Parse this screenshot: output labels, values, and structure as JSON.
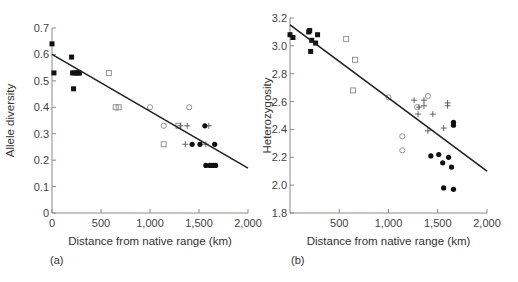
{
  "figure": {
    "panels": [
      "(a)",
      "(b)"
    ]
  },
  "chart_data": [
    {
      "type": "scatter",
      "panel_label": "(a)",
      "title": "",
      "xlabel": "Distance from native range (km)",
      "ylabel": "Allele diversity",
      "xlim": [
        0,
        2000
      ],
      "ylim": [
        0,
        0.7
      ],
      "xticks": [
        0,
        500,
        1000,
        1500,
        2000
      ],
      "xtick_labels": [
        "0",
        "500",
        "1,000",
        "1,500",
        "2,000"
      ],
      "yticks": [
        0,
        0.1,
        0.2,
        0.3,
        0.4,
        0.5,
        0.6,
        0.7
      ],
      "ytick_labels": [
        "0",
        "0.1",
        "0.2",
        "0.3",
        "0.4",
        "0.5",
        "0.6",
        "0.7"
      ],
      "grid": false,
      "legend": null,
      "regression_line": {
        "x": [
          0,
          2000
        ],
        "y": [
          0.6,
          0.17
        ]
      },
      "series": [
        {
          "name": "filled-square",
          "marker": "square-filled",
          "x": [
            0,
            20,
            200,
            210,
            220,
            230,
            250,
            270,
            280
          ],
          "y": [
            0.64,
            0.53,
            0.59,
            0.53,
            0.47,
            0.53,
            0.53,
            0.53,
            0.53
          ]
        },
        {
          "name": "open-square",
          "marker": "square-open",
          "x": [
            580,
            650,
            680,
            1140,
            1290
          ],
          "y": [
            0.53,
            0.4,
            0.4,
            0.26,
            0.33
          ]
        },
        {
          "name": "open-circle",
          "marker": "circle-open",
          "x": [
            1000,
            1140,
            1400
          ],
          "y": [
            0.4,
            0.33,
            0.4
          ]
        },
        {
          "name": "plus",
          "marker": "plus",
          "x": [
            1310,
            1380,
            1360,
            1600,
            1570
          ],
          "y": [
            0.33,
            0.33,
            0.26,
            0.33,
            0.26
          ]
        },
        {
          "name": "filled-circle",
          "marker": "circle-filled",
          "x": [
            1430,
            1510,
            1560,
            1660,
            1570,
            1610,
            1630,
            1650,
            1670
          ],
          "y": [
            0.26,
            0.26,
            0.33,
            0.26,
            0.18,
            0.18,
            0.18,
            0.18,
            0.18
          ]
        }
      ]
    },
    {
      "type": "scatter",
      "panel_label": "(b)",
      "title": "",
      "xlabel": "Distance from native range (km)",
      "ylabel": "Heterozygosity",
      "xlim": [
        0,
        2000
      ],
      "ylim": [
        1.8,
        3.2
      ],
      "xticks": [
        500,
        1000,
        1500,
        2000
      ],
      "xtick_labels": [
        "500",
        "1,000",
        "1,500",
        "2,000"
      ],
      "yticks": [
        1.8,
        2.0,
        2.2,
        2.4,
        2.6,
        2.8,
        3.0,
        3.2
      ],
      "ytick_labels": [
        "1.8",
        "2.0",
        "2.2",
        "2.4",
        "2.6",
        "2.8",
        "3.0",
        "3.2"
      ],
      "grid": false,
      "legend": null,
      "regression_line": {
        "x": [
          0,
          2000
        ],
        "y": [
          3.15,
          2.1
        ]
      },
      "series": [
        {
          "name": "filled-square",
          "marker": "square-filled",
          "x": [
            0,
            30,
            190,
            200,
            210,
            220,
            260,
            280
          ],
          "y": [
            3.08,
            3.06,
            3.1,
            3.11,
            2.96,
            3.04,
            3.02,
            3.08
          ]
        },
        {
          "name": "open-square",
          "marker": "square-open",
          "x": [
            570,
            660,
            640
          ],
          "y": [
            3.05,
            2.9,
            2.68
          ]
        },
        {
          "name": "open-circle",
          "marker": "circle-open",
          "x": [
            1000,
            1140,
            1140,
            1290,
            1400
          ],
          "y": [
            2.63,
            2.35,
            2.25,
            2.56,
            2.64
          ]
        },
        {
          "name": "plus",
          "marker": "plus",
          "x": [
            1260,
            1300,
            1310,
            1360,
            1360,
            1400,
            1450,
            1600,
            1600,
            1560
          ],
          "y": [
            2.61,
            2.51,
            2.56,
            2.57,
            2.61,
            2.39,
            2.51,
            2.59,
            2.57,
            2.41
          ]
        },
        {
          "name": "filled-circle",
          "marker": "circle-filled",
          "x": [
            1430,
            1510,
            1550,
            1610,
            1640,
            1660,
            1660,
            1560,
            1660
          ],
          "y": [
            2.21,
            2.22,
            2.16,
            2.2,
            2.13,
            2.45,
            2.43,
            1.98,
            1.97
          ]
        }
      ]
    }
  ],
  "layout": {
    "panels": [
      {
        "plot": {
          "x0": 52,
          "x1": 248,
          "y0": 213,
          "y1": 28
        },
        "ylabel_x": 14,
        "panel_label_pos": [
          50,
          264
        ]
      },
      {
        "plot": {
          "x0": 290,
          "x1": 487,
          "y0": 213,
          "y1": 18
        },
        "ylabel_x": 271,
        "panel_label_pos": [
          291,
          264
        ]
      }
    ],
    "colors": {
      "axis": "#8a8a8a",
      "line": "#222222",
      "marker_filled": "#111111",
      "marker_open": "#888888",
      "plus": "#555555"
    }
  }
}
